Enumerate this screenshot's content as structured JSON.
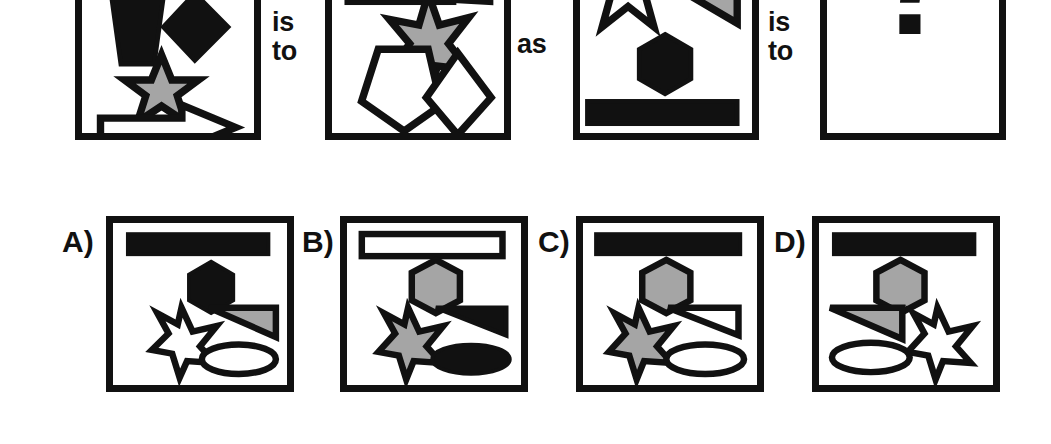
{
  "puzzle": {
    "type": "visual-analogy-multiple-choice",
    "relations": {
      "is_to_1": "is\nto",
      "as": "as",
      "is_to_2": "is\nto"
    },
    "colors": {
      "black": "#111111",
      "gray": "#a5a5a5",
      "white": "#ffffff",
      "background": "#ffffff"
    },
    "prompt_panels": [
      {
        "id": "panel-1",
        "name": "analogy-panel-a",
        "shapes": [
          {
            "shape": "pentagon",
            "fill": "black",
            "position": "top-left"
          },
          {
            "shape": "diamond",
            "fill": "black",
            "position": "top-right"
          },
          {
            "shape": "star",
            "fill": "gray",
            "position": "middle-center"
          },
          {
            "shape": "arrow-right",
            "fill": "white",
            "position": "bottom"
          }
        ]
      },
      {
        "id": "panel-2",
        "name": "analogy-panel-b",
        "shapes": [
          {
            "shape": "bar",
            "fill": "black",
            "position": "top"
          },
          {
            "shape": "triangle",
            "fill": "black",
            "position": "top-right"
          },
          {
            "shape": "star",
            "fill": "gray",
            "position": "middle-center"
          },
          {
            "shape": "pentagon",
            "fill": "white",
            "position": "bottom-left"
          },
          {
            "shape": "diamond",
            "fill": "white",
            "position": "bottom-right"
          }
        ]
      },
      {
        "id": "panel-3",
        "name": "analogy-panel-c",
        "shapes": [
          {
            "shape": "star",
            "fill": "white",
            "position": "top-left"
          },
          {
            "shape": "ellipse",
            "fill": "white",
            "position": "top-right"
          },
          {
            "shape": "triangle",
            "fill": "gray",
            "position": "upper-right"
          },
          {
            "shape": "hexagon",
            "fill": "black",
            "position": "middle-center"
          },
          {
            "shape": "bar",
            "fill": "black",
            "position": "bottom"
          }
        ]
      },
      {
        "id": "panel-4",
        "name": "analogy-panel-answer-slot",
        "content": "?",
        "shapes": []
      }
    ],
    "options": [
      {
        "id": "option-a",
        "label": "A)",
        "shapes": [
          {
            "shape": "bar",
            "fill": "black",
            "position": "top"
          },
          {
            "shape": "hexagon",
            "fill": "black",
            "position": "upper-center"
          },
          {
            "shape": "star",
            "fill": "white",
            "position": "lower-left"
          },
          {
            "shape": "triangle",
            "fill": "gray",
            "position": "lower-right"
          },
          {
            "shape": "ellipse",
            "fill": "white",
            "position": "bottom-right"
          }
        ]
      },
      {
        "id": "option-b",
        "label": "B)",
        "shapes": [
          {
            "shape": "bar",
            "fill": "white",
            "position": "top"
          },
          {
            "shape": "hexagon",
            "fill": "gray",
            "position": "upper-center"
          },
          {
            "shape": "star",
            "fill": "gray",
            "position": "lower-left"
          },
          {
            "shape": "triangle",
            "fill": "black",
            "position": "lower-right"
          },
          {
            "shape": "ellipse",
            "fill": "black",
            "position": "bottom-right"
          }
        ]
      },
      {
        "id": "option-c",
        "label": "C)",
        "shapes": [
          {
            "shape": "bar",
            "fill": "black",
            "position": "top"
          },
          {
            "shape": "hexagon",
            "fill": "gray",
            "position": "upper-center"
          },
          {
            "shape": "star",
            "fill": "gray",
            "position": "lower-left"
          },
          {
            "shape": "triangle",
            "fill": "white",
            "position": "lower-right"
          },
          {
            "shape": "ellipse",
            "fill": "white",
            "position": "bottom-right"
          }
        ]
      },
      {
        "id": "option-d",
        "label": "D)",
        "shapes": [
          {
            "shape": "bar",
            "fill": "black",
            "position": "top"
          },
          {
            "shape": "hexagon",
            "fill": "gray",
            "position": "upper-center"
          },
          {
            "shape": "triangle",
            "fill": "gray",
            "position": "lower-left"
          },
          {
            "shape": "star",
            "fill": "white",
            "position": "lower-right"
          },
          {
            "shape": "ellipse",
            "fill": "white",
            "position": "bottom-left"
          }
        ]
      }
    ]
  }
}
